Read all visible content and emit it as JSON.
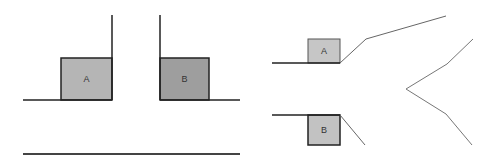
{
  "diagram": {
    "left_figure": {
      "box_a": {
        "label": "A",
        "x": 61,
        "y": 58,
        "w": 51,
        "h": 42,
        "fill": "#b5b5b5",
        "stroke": "#222222"
      },
      "box_b": {
        "label": "B",
        "x": 160,
        "y": 58,
        "w": 49,
        "h": 42,
        "fill": "#9e9e9e",
        "stroke": "#222222"
      },
      "ground_left": {
        "x1": 23,
        "y1": 100,
        "x2": 112,
        "y2": 100
      },
      "wall_a": {
        "x1": 112,
        "y1": 15,
        "x2": 112,
        "y2": 100
      },
      "wall_b": {
        "x1": 160,
        "y1": 15,
        "x2": 160,
        "y2": 100
      },
      "ground_right": {
        "x1": 160,
        "y1": 100,
        "x2": 240,
        "y2": 100
      },
      "bottom_line": {
        "x1": 23,
        "y1": 154,
        "x2": 240,
        "y2": 154
      }
    },
    "right_figure": {
      "box_a": {
        "label": "A",
        "x": 308,
        "y": 39,
        "w": 32,
        "h": 24,
        "fill": "#c6c6c6",
        "stroke": "#555555"
      },
      "box_b": {
        "label": "B",
        "x": 308,
        "y": 115,
        "w": 32,
        "h": 30,
        "fill": "#c2c2c2",
        "stroke": "#222222"
      },
      "ledge_a": {
        "x1": 272,
        "y1": 63,
        "x2": 340,
        "y2": 63
      },
      "ledge_b": {
        "x1": 272,
        "y1": 115,
        "x2": 340,
        "y2": 115
      },
      "upper_path": "340,63 366,39 446,16",
      "lower_path": "340,115 365,145",
      "zigzag_path": "473,39 447,64 406,89 446,114 472,145"
    },
    "colors": {
      "line_dark": "#222222",
      "line_gray": "#666666"
    }
  }
}
